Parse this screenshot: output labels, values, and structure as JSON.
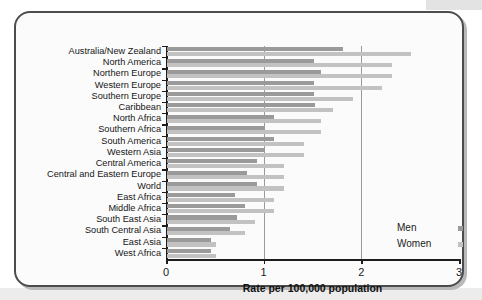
{
  "chart_data": {
    "type": "bar",
    "orientation": "horizontal",
    "title": "",
    "xlabel": "Rate per 100,000 population",
    "ylabel": "",
    "xlim": [
      0,
      3
    ],
    "xticks": [
      0,
      1,
      2,
      3
    ],
    "xtick_labels": [
      "0",
      "1",
      "2",
      "3"
    ],
    "grid": "vertical gridlines at 1 and 2",
    "legend_position": "bottom-right inside plot",
    "categories": [
      "Australia/New Zealand",
      "North America",
      "Northern Europe",
      "Western Europe",
      "Southern Europe",
      "Caribbean",
      "North Africa",
      "Southern Africa",
      "South America",
      "Western Asia",
      "Central America",
      "Central and Eastern Europe",
      "World",
      "East Africa",
      "Middle Africa",
      "South East Asia",
      "South Central Asia",
      "East Asia",
      "West Africa"
    ],
    "series": [
      {
        "name": "Men",
        "color": "#9a9a9a",
        "values": [
          1.8,
          1.5,
          1.58,
          1.5,
          1.5,
          1.52,
          1.1,
          1.0,
          1.1,
          1.0,
          0.92,
          0.82,
          0.92,
          0.7,
          0.8,
          0.72,
          0.65,
          0.45,
          0.45
        ]
      },
      {
        "name": "Women",
        "color": "#c2c2c2",
        "values": [
          2.5,
          2.3,
          2.3,
          2.2,
          1.9,
          1.7,
          1.58,
          1.58,
          1.4,
          1.4,
          1.2,
          1.2,
          1.2,
          1.1,
          1.1,
          0.9,
          0.8,
          0.5,
          0.5
        ]
      }
    ]
  },
  "legend": {
    "items": [
      {
        "label": "Men",
        "color": "#9a9a9a"
      },
      {
        "label": "Women",
        "color": "#c2c2c2"
      }
    ]
  },
  "axis": {
    "x_title": "Rate per 100,000 population"
  }
}
